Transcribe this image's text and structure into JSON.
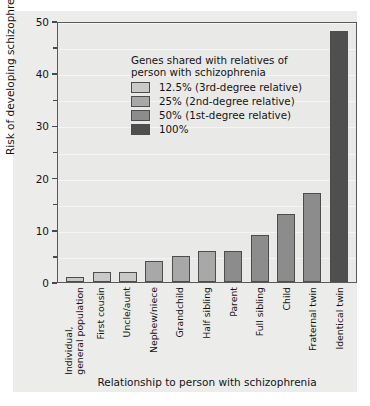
{
  "chart_data": {
    "type": "bar",
    "title": "",
    "xlabel": "Relationship to person with schizophrenia",
    "ylabel": "Risk of developing schizophrenia (%)",
    "ylim": [
      0,
      50
    ],
    "yticks": [
      0,
      10,
      20,
      30,
      40,
      50
    ],
    "ytick_labels": [
      "0",
      "10",
      "20",
      "30",
      "40",
      "50"
    ],
    "yticks_minor": [
      5,
      15,
      25,
      35,
      45
    ],
    "grid": "light horizontal",
    "legend_position": "upper-left inside plot",
    "categories": [
      "Individual, general population",
      "First cousin",
      "Uncle/aunt",
      "Nephew/niece",
      "Grandchild",
      "Half sibling",
      "Parent",
      "Full sibling",
      "Child",
      "Fraternal twin",
      "Identical twin"
    ],
    "values": [
      1,
      2,
      2,
      4,
      5,
      6,
      6,
      9,
      13,
      17,
      48
    ],
    "bar_groups": [
      "12.5%",
      "12.5%",
      "12.5%",
      "25%",
      "25%",
      "25%",
      "50%",
      "50%",
      "50%",
      "50%",
      "100%"
    ],
    "bar_colors": [
      "#c9c9c9",
      "#c9c9c9",
      "#c9c9c9",
      "#a8a8a8",
      "#a8a8a8",
      "#a8a8a8",
      "#8c8c8c",
      "#8c8c8c",
      "#8c8c8c",
      "#8c8c8c",
      "#4f4f4f"
    ]
  },
  "axes": {
    "y_title": "Risk of developing schizophrenia (%)",
    "x_title": "Relationship to person with schizophrenia",
    "y_tick_labels": [
      "50",
      "40",
      "30",
      "20",
      "10",
      "0"
    ]
  },
  "x_categories": [
    {
      "line1": "Individual,",
      "line2": "general population"
    },
    {
      "line1": "First cousin",
      "line2": ""
    },
    {
      "line1": "Uncle/aunt",
      "line2": ""
    },
    {
      "line1": "Nephew/niece",
      "line2": ""
    },
    {
      "line1": "Grandchild",
      "line2": ""
    },
    {
      "line1": "Half sibling",
      "line2": ""
    },
    {
      "line1": "Parent",
      "line2": ""
    },
    {
      "line1": "Full sibling",
      "line2": ""
    },
    {
      "line1": "Child",
      "line2": ""
    },
    {
      "line1": "Fraternal twin",
      "line2": ""
    },
    {
      "line1": "Identical twin",
      "line2": ""
    }
  ],
  "legend": {
    "title_line1": "Genes shared with relatives of",
    "title_line2": "person with schizophrenia",
    "items": [
      {
        "label": "12.5% (3rd-degree relative)",
        "color": "#c9c9c9"
      },
      {
        "label": "25% (2nd-degree relative)",
        "color": "#a8a8a8"
      },
      {
        "label": "50% (1st-degree relative)",
        "color": "#8c8c8c"
      },
      {
        "label": "100%",
        "color": "#4f4f4f"
      }
    ]
  },
  "colors": {
    "page_background": "#ffffff",
    "panel_background": "#ececeb",
    "plot_background": "#e9e9e8",
    "axis_line": "#5a5a5a",
    "text": "#141414"
  }
}
